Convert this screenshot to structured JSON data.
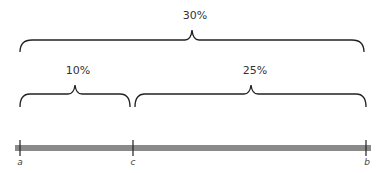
{
  "diagram": {
    "braces": [
      {
        "id": "total",
        "label": "30%",
        "from": "a",
        "to": "b"
      },
      {
        "id": "left",
        "label": "10%",
        "from": "a",
        "to": "c"
      },
      {
        "id": "right",
        "label": "25%",
        "from": "c",
        "to": "b"
      }
    ],
    "points": [
      {
        "name": "a",
        "label": "a"
      },
      {
        "name": "c",
        "label": "c"
      },
      {
        "name": "b",
        "label": "b"
      }
    ],
    "colors": {
      "bar": "#8a8a8a",
      "line": "#222222"
    }
  }
}
